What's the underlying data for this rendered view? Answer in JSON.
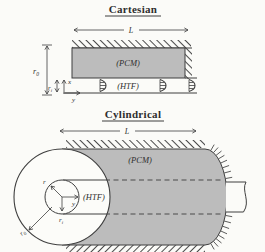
{
  "figure": {
    "colors": {
      "pcm_fill": "#bcbcbc",
      "line": "#3f3f3f",
      "background": "#fbfbf8",
      "shell_face": "#fcfcf9"
    },
    "cartesian": {
      "title": "Cartesian",
      "length_label": "L",
      "pcm_label": "(PCM)",
      "htf_label": "(HTF)",
      "outer_radius_base": "r",
      "outer_radius_sub": "0",
      "inner_radius_base": "r",
      "inner_radius_sub": "i",
      "axis_vertical": "x",
      "axis_horizontal": "y"
    },
    "cylindrical": {
      "title": "Cylindrical",
      "length_label": "L",
      "pcm_label": "(PCM)",
      "htf_label": "(HTF)",
      "outer_radius_base": "r",
      "outer_radius_sub": "0",
      "inner_radius_base": "r",
      "inner_radius_sub": "i",
      "axis_radial": "r",
      "axis_axial": "y"
    }
  }
}
